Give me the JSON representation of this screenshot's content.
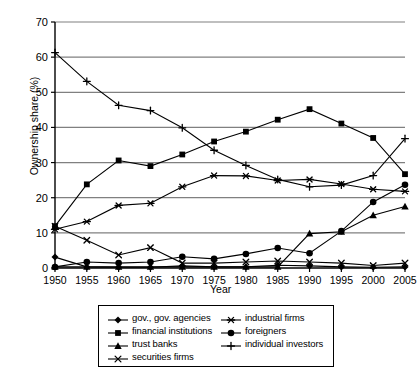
{
  "chart_data": {
    "type": "line",
    "title": "",
    "xlabel": "Year",
    "ylabel": "Ownership share (%)",
    "x": [
      1950,
      1955,
      1960,
      1965,
      1970,
      1975,
      1980,
      1985,
      1990,
      1995,
      2000,
      2005
    ],
    "xticklabels": [
      "1950",
      "1955",
      "1960",
      "1965",
      "1970",
      "1975",
      "1980",
      "1985",
      "1990",
      "1995",
      "2000",
      "2005"
    ],
    "yticklabels": [
      "0",
      "10",
      "20",
      "30",
      "40",
      "50",
      "60",
      "70"
    ],
    "ylim": [
      0,
      70
    ],
    "ytick_step": 10,
    "xlim": [
      1950,
      2005
    ],
    "grid": "horizontal",
    "legend_position": "bottom",
    "series": [
      {
        "name": "gov., gov. agencies",
        "marker": "diamond",
        "values": [
          3.1,
          0.3,
          0.2,
          0.2,
          0.6,
          0.3,
          0.3,
          0.8,
          0.6,
          0.3,
          0.2,
          0.3
        ]
      },
      {
        "name": "financial institutions",
        "marker": "square",
        "values": [
          11.9,
          23.8,
          30.6,
          29.0,
          32.3,
          36.0,
          38.8,
          42.2,
          45.2,
          41.1,
          37.0,
          26.7
        ]
      },
      {
        "name": "trust banks",
        "marker": "triangle",
        "values": [
          0.3,
          0.3,
          0.3,
          0.3,
          0.3,
          0.3,
          0.3,
          0.3,
          9.8,
          10.3,
          15.0,
          17.5
        ]
      },
      {
        "name": "securities firms",
        "marker": "cross-x",
        "values": [
          11.9,
          7.9,
          3.7,
          5.8,
          1.4,
          1.4,
          1.7,
          2.0,
          1.7,
          1.4,
          0.7,
          1.4
        ]
      },
      {
        "name": "industrial firms",
        "marker": "asterisk",
        "values": [
          11.0,
          13.2,
          17.8,
          18.4,
          23.1,
          26.3,
          26.2,
          24.9,
          25.2,
          23.9,
          22.4,
          21.8
        ]
      },
      {
        "name": "foreigners",
        "marker": "circle",
        "values": [
          0.3,
          1.7,
          1.4,
          1.7,
          3.2,
          2.6,
          4.0,
          5.7,
          4.2,
          10.5,
          18.8,
          23.7
        ]
      },
      {
        "name": "individual investors",
        "marker": "plus",
        "values": [
          61.3,
          53.1,
          46.3,
          44.8,
          39.9,
          33.5,
          29.2,
          25.2,
          23.1,
          23.6,
          26.3,
          36.8
        ]
      }
    ]
  },
  "legend": {
    "left_column": [
      {
        "label": "gov., gov. agencies",
        "marker": "diamond"
      },
      {
        "label": "financial institutions",
        "marker": "square"
      },
      {
        "label": "trust banks",
        "marker": "triangle"
      },
      {
        "label": "securities firms",
        "marker": "cross-x"
      }
    ],
    "right_column": [
      {
        "label": "industrial firms",
        "marker": "asterisk"
      },
      {
        "label": "foreigners",
        "marker": "circle"
      },
      {
        "label": "individual investors",
        "marker": "plus"
      }
    ]
  },
  "colors": {
    "line": "#000000",
    "grid": "#808080",
    "axis": "#000000",
    "background": "#ffffff"
  }
}
